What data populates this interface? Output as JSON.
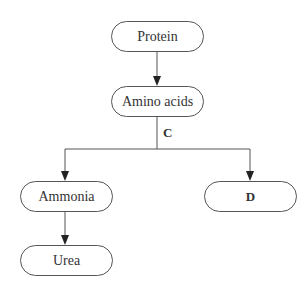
{
  "diagram": {
    "nodes": {
      "protein": "Protein",
      "amino_acids": "Amino acids",
      "ammonia": "Ammonia",
      "d": "D",
      "urea": "Urea"
    },
    "edge_labels": {
      "c": "C"
    },
    "edges": [
      {
        "from": "Protein",
        "to": "Amino acids"
      },
      {
        "from": "Amino acids",
        "to": "Ammonia",
        "label": "C"
      },
      {
        "from": "Amino acids",
        "to": "D",
        "label": "C"
      },
      {
        "from": "Ammonia",
        "to": "Urea"
      }
    ],
    "colors": {
      "stroke": "#555555",
      "text": "#333333",
      "background": "#ffffff"
    }
  }
}
